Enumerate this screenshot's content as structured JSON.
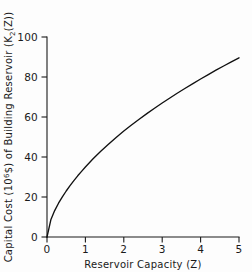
{
  "chart_data": {
    "type": "line",
    "title": "",
    "xlabel": "Reservoir Capacity (Z)",
    "ylabel": "Capital Cost (10^6 $) of Building Reservoir (K2(Z))",
    "ylabel_parts": {
      "lead": "Capital Cost (10",
      "exp": "6",
      "mid": "$) of Building Reservoir (K",
      "sub": "2",
      "tail": "(Z))"
    },
    "xlim": [
      0,
      5
    ],
    "ylim": [
      0,
      100
    ],
    "xticks": [
      0,
      1,
      2,
      3,
      4,
      5
    ],
    "yticks": [
      0,
      20,
      40,
      60,
      80,
      100
    ],
    "xtick_labels": [
      "0",
      "1",
      "2",
      "3",
      "4",
      "5"
    ],
    "ytick_labels": [
      "0",
      "20",
      "40",
      "60",
      "80",
      "100"
    ],
    "grid": false,
    "legend": false,
    "series": [
      {
        "name": "K2(Z)",
        "color": "#111111",
        "x": [
          0.0,
          0.1,
          0.2,
          0.3,
          0.4,
          0.5,
          0.6,
          0.7,
          0.8,
          0.9,
          1.0,
          1.2,
          1.4,
          1.6,
          1.8,
          2.0,
          2.2,
          2.4,
          2.6,
          2.8,
          3.0,
          3.2,
          3.4,
          3.6,
          3.8,
          4.0,
          4.2,
          4.4,
          4.6,
          4.8,
          5.0
        ],
        "y": [
          0.0,
          8.6,
          13.2,
          16.9,
          20.1,
          23.0,
          25.7,
          28.2,
          30.6,
          32.8,
          35.0,
          39.1,
          42.9,
          46.4,
          49.8,
          53.0,
          56.0,
          58.9,
          61.7,
          64.4,
          67.0,
          69.5,
          72.0,
          74.4,
          76.7,
          79.0,
          81.2,
          83.4,
          85.5,
          87.6,
          89.6
        ]
      }
    ],
    "notable_points": [
      {
        "x": 1,
        "y": 42
      },
      {
        "x": 2,
        "y": 60
      },
      {
        "x": 3,
        "y": 71
      },
      {
        "x": 4,
        "y": 83
      },
      {
        "x": 5,
        "y": 95
      }
    ],
    "colors": {
      "background": "#fdfdfd",
      "axis": "#1a1a1a",
      "curve": "#111111"
    }
  }
}
